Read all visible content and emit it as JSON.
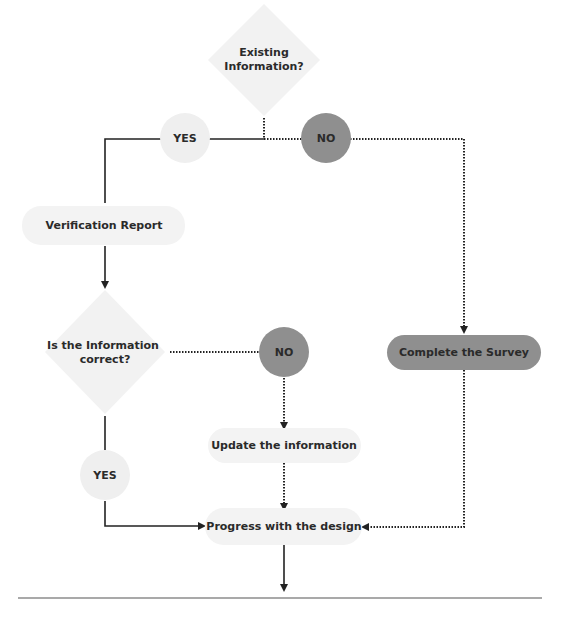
{
  "diagram": {
    "type": "flowchart",
    "colors": {
      "light_fill": "#f2f2f2",
      "dark_fill": "#8f8f8f",
      "line": "#222222",
      "divider": "#555555",
      "text": "#2a2a2a"
    },
    "nodes": {
      "existing_info": {
        "shape": "diamond",
        "line1": "Existing",
        "line2": "Information?"
      },
      "yes_1": {
        "shape": "circle",
        "label": "YES"
      },
      "no_1": {
        "shape": "circle",
        "label": "NO"
      },
      "verification_report": {
        "shape": "pill",
        "label": "Verification Report"
      },
      "info_correct": {
        "shape": "diamond",
        "line1": "Is the Information",
        "line2": "correct?"
      },
      "no_2": {
        "shape": "circle",
        "label": "NO"
      },
      "complete_survey": {
        "shape": "pill",
        "label": "Complete the Survey"
      },
      "update_info": {
        "shape": "pill",
        "label": "Update the information"
      },
      "yes_2": {
        "shape": "circle",
        "label": "YES"
      },
      "progress_design": {
        "shape": "pill",
        "label": "Progress with the design"
      }
    },
    "edges": [
      {
        "from": "existing_info",
        "to": "yes_1",
        "style": "solid"
      },
      {
        "from": "yes_1",
        "to": "verification_report",
        "style": "solid"
      },
      {
        "from": "existing_info",
        "to": "no_1",
        "style": "dotted"
      },
      {
        "from": "no_1",
        "to": "complete_survey",
        "style": "dotted"
      },
      {
        "from": "verification_report",
        "to": "info_correct",
        "style": "solid"
      },
      {
        "from": "info_correct",
        "to": "no_2",
        "style": "dotted"
      },
      {
        "from": "no_2",
        "to": "update_info",
        "style": "dotted"
      },
      {
        "from": "update_info",
        "to": "progress_design",
        "style": "dotted"
      },
      {
        "from": "info_correct",
        "to": "yes_2",
        "style": "solid"
      },
      {
        "from": "yes_2",
        "to": "progress_design",
        "style": "solid"
      },
      {
        "from": "complete_survey",
        "to": "progress_design",
        "style": "dotted"
      },
      {
        "from": "progress_design",
        "to": "next",
        "style": "solid"
      }
    ]
  }
}
